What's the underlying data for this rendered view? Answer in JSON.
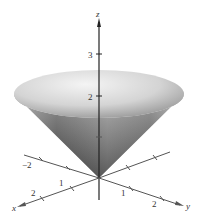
{
  "figure": {
    "axes": {
      "z": {
        "label": "z",
        "ticks": [
          "1",
          "2",
          "3"
        ],
        "tick_labels_shown": [
          "2",
          "3"
        ]
      },
      "x": {
        "label": "x",
        "tick_labels_shown": [
          "1",
          "2",
          "-2"
        ]
      },
      "y": {
        "label": "y",
        "tick_labels_shown": [
          "1",
          "2"
        ]
      }
    },
    "labels": {
      "z_axis": "z",
      "x_axis": "x",
      "y_axis": "y",
      "z3": "3",
      "z2": "2",
      "x_neg2": "−2",
      "x1": "1",
      "x2": "2",
      "y1": "1",
      "y2": "2"
    },
    "colors": {
      "axis": "#4a4a4a",
      "surface_light": "#f2f2f2",
      "surface_mid": "#b8b8b8",
      "surface_dark": "#3c3c3c",
      "background": "#ffffff"
    }
  }
}
